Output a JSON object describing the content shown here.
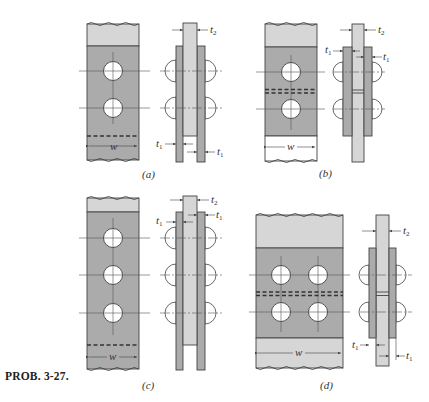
{
  "figure": {
    "caption": "PROB. 3-27.",
    "colors": {
      "light_plate": "#d6d6d6",
      "dark_plate": "#ababab",
      "outline": "#444444",
      "hole": "#ffffff",
      "background": "#ffffff"
    },
    "panels": [
      {
        "id": "a",
        "label": "(a)",
        "description": "Single-lap-strap joint: center plate between two outer plates, two rivet rows",
        "front_view": {
          "rivet_rows": 2,
          "rivets_per_row": 1,
          "width_label": "w",
          "cut_line": "single dashed"
        },
        "side_view": {
          "labels": [
            "t2",
            "t1",
            "t1"
          ]
        }
      },
      {
        "id": "b",
        "label": "(b)",
        "description": "Butt joint with double straps, one rivet each side of butt line",
        "front_view": {
          "rivet_rows": 2,
          "rivets_per_row": 1,
          "width_label": "w",
          "cut_line": "double dashed"
        },
        "side_view": {
          "labels": [
            "t2",
            "t1",
            "t1"
          ]
        }
      },
      {
        "id": "c",
        "label": "(c)",
        "description": "Strap joint with three rivet rows",
        "front_view": {
          "rivet_rows": 3,
          "rivets_per_row": 1,
          "width_label": "w",
          "cut_line": "single dashed"
        },
        "side_view": {
          "labels": [
            "t2",
            "t1",
            "t1"
          ]
        }
      },
      {
        "id": "d",
        "label": "(d)",
        "description": "Butt joint with double straps, two rivets per row",
        "front_view": {
          "rivet_rows": 2,
          "rivets_per_row": 2,
          "width_label": "w",
          "cut_line": "double dashed"
        },
        "side_view": {
          "labels": [
            "t2",
            "t1",
            "t1"
          ]
        }
      }
    ],
    "dimension_labels": {
      "width": "w",
      "strap_thickness": "t",
      "strap_sub": "1",
      "plate_thickness": "t",
      "plate_sub": "2"
    }
  }
}
